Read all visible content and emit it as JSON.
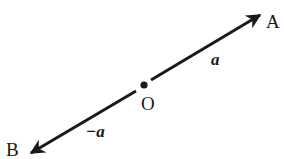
{
  "diagram": {
    "type": "vector-diagram",
    "colors": {
      "line": "#1a1a1a",
      "background": "#ffffff"
    },
    "points": {
      "A": {
        "label": "A"
      },
      "O": {
        "label": "O"
      },
      "B": {
        "label": "B"
      }
    },
    "vectors": [
      {
        "from": "O",
        "to": "A",
        "label": "a"
      },
      {
        "from": "O",
        "to": "B",
        "label": "−a"
      }
    ]
  }
}
